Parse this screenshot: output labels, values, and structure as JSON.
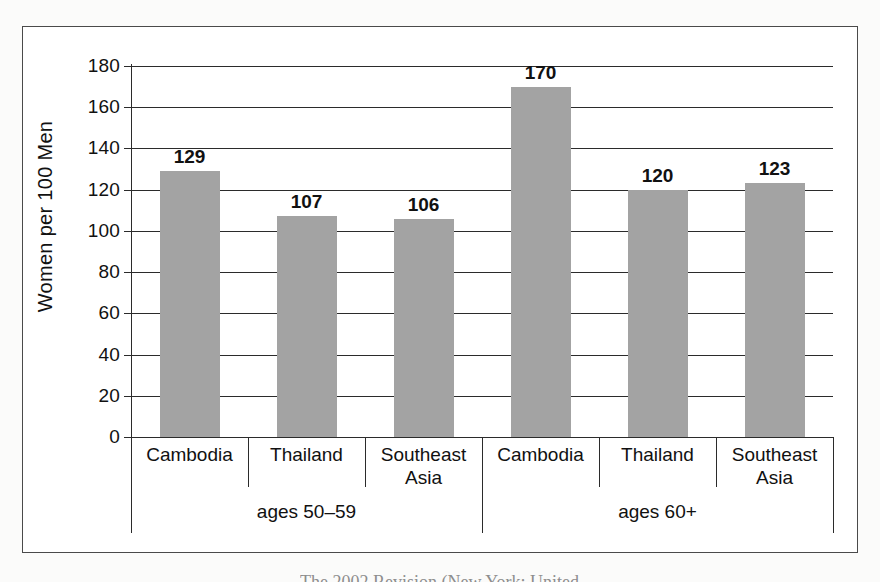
{
  "figure": {
    "caption_partial": "The 2002 Revision (New York: United"
  },
  "chart_data": {
    "type": "bar",
    "title": "",
    "xlabel": "",
    "ylabel": "Women per 100 Men",
    "ylim": [
      0,
      180
    ],
    "ytick_step": 20,
    "yticks": [
      180,
      160,
      140,
      120,
      100,
      80,
      60,
      40,
      20,
      0
    ],
    "ytick_labels": [
      "180",
      "160",
      "140",
      "120",
      "100",
      "80",
      "60",
      "40",
      "20",
      "0"
    ],
    "grid": true,
    "legend": "none",
    "group_labels": [
      "ages 50–59",
      "ages 60+"
    ],
    "categories": [
      "Cambodia",
      "Thailand",
      "Southeast Asia",
      "Cambodia",
      "Thailand",
      "Southeast Asia"
    ],
    "values": [
      129,
      107,
      106,
      170,
      120,
      123
    ],
    "value_labels": [
      "129",
      "107",
      "106",
      "170",
      "120",
      "123"
    ],
    "groups": [
      {
        "name": "ages 50–59",
        "categories": [
          "Cambodia",
          "Thailand",
          "Southeast Asia"
        ],
        "values": [
          129,
          107,
          106
        ]
      },
      {
        "name": "ages 60+",
        "categories": [
          "Cambodia",
          "Thailand",
          "Southeast Asia"
        ],
        "values": [
          170,
          120,
          123
        ]
      }
    ],
    "colors": {
      "bar": "#a3a3a3",
      "axis": "#2b2b2b",
      "grid": "#2b2b2b",
      "text": "#111111",
      "frame": "#4a4a4a",
      "background": "#ffffff"
    }
  }
}
